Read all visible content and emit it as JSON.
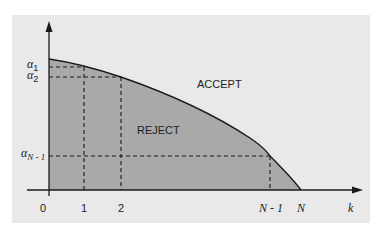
{
  "colors": {
    "page_bg": "#ffffff",
    "panel_bg": "#e9e9e9",
    "reject_fill": "#a9a9a9",
    "line": "#1a1a1a"
  },
  "regions": {
    "accept_label": "ACCEPT",
    "reject_label": "REJECT"
  },
  "y_axis": {
    "ticks": [
      {
        "symbol": "α",
        "subscript": "1"
      },
      {
        "symbol": "α",
        "subscript": "2"
      },
      {
        "symbol": "α",
        "subscript": "N - 1"
      }
    ]
  },
  "x_axis": {
    "label": "k",
    "ticks": [
      "0",
      "1",
      "2",
      "N - 1",
      "N"
    ]
  }
}
